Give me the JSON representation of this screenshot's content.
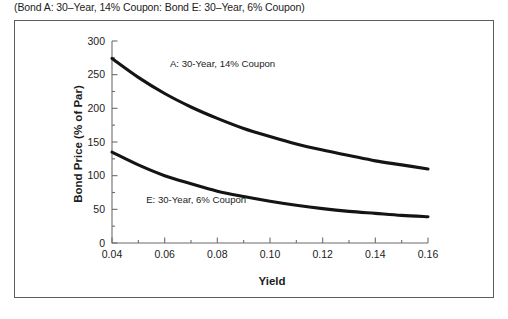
{
  "caption": "(Bond A: 30–Year, 14% Coupon: Bond E: 30–Year, 6% Coupon)",
  "axes": {
    "ylabel": "Bond Price (% of Par)",
    "xlabel": "Yield",
    "y_ticks": [
      "0",
      "50",
      "100",
      "150",
      "200",
      "250",
      "300"
    ],
    "x_ticks": [
      "0.04",
      "0.06",
      "0.08",
      "0.10",
      "0.12",
      "0.14",
      "0.16"
    ]
  },
  "annotations": {
    "curve_a": "A: 30-Year, 14% Coupon",
    "curve_e": "E: 30-Year, 6% Coupon"
  },
  "colors": {
    "curve": "#141414",
    "axis": "#6d6d6d",
    "frame": "#5c5c5c",
    "text": "#1c1c1c",
    "background": "#ffffff"
  },
  "chart_data": {
    "type": "line",
    "title": "(Bond A: 30–Year, 14% Coupon: Bond E: 30–Year, 6% Coupon)",
    "xlabel": "Yield",
    "ylabel": "Bond Price (% of Par)",
    "xlim": [
      0.04,
      0.16
    ],
    "ylim": [
      0,
      300
    ],
    "xticks": [
      0.04,
      0.06,
      0.08,
      0.1,
      0.12,
      0.14,
      0.16
    ],
    "yticks": [
      0,
      50,
      100,
      150,
      200,
      250,
      300
    ],
    "x_minor_ticks": [
      0.05,
      0.07,
      0.09,
      0.11,
      0.13,
      0.15
    ],
    "y_minor_ticks": [
      25,
      75,
      125,
      175,
      225,
      275
    ],
    "grid": false,
    "legend": "inline-annotations",
    "x": [
      0.04,
      0.05,
      0.06,
      0.07,
      0.08,
      0.09,
      0.1,
      0.11,
      0.12,
      0.13,
      0.14,
      0.15,
      0.16
    ],
    "series": [
      {
        "name": "A: 30-Year, 14% Coupon",
        "label": "A: 30-Year, 14% Coupon",
        "label_x": 0.062,
        "label_y": 262,
        "values": [
          274,
          246,
          222,
          202,
          185,
          170,
          158,
          147,
          138,
          130,
          122,
          116,
          110
        ]
      },
      {
        "name": "E: 30-Year, 6% Coupon",
        "label": "E: 30-Year, 6% Coupon",
        "label_x": 0.053,
        "label_y": 60,
        "values": [
          135,
          116,
          100,
          88,
          77,
          69,
          62,
          56,
          51,
          47,
          44,
          41,
          39
        ]
      }
    ]
  }
}
